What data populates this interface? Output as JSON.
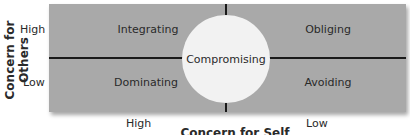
{
  "diagram": {
    "y_axis_label": "Concern for Others",
    "x_axis_label": "Concern for Self",
    "y_ticks": [
      "High",
      "Low"
    ],
    "x_ticks": [
      "High",
      "Low"
    ],
    "quadrants": {
      "top_left": "Integrating",
      "top_right": "Obliging",
      "bottom_left": "Dominating",
      "bottom_right": "Avoiding"
    },
    "center": "Compromising",
    "colors": {
      "background": "#a9a9a9",
      "circle": "#f2f2f2",
      "lines": "#1a1a1a"
    }
  }
}
